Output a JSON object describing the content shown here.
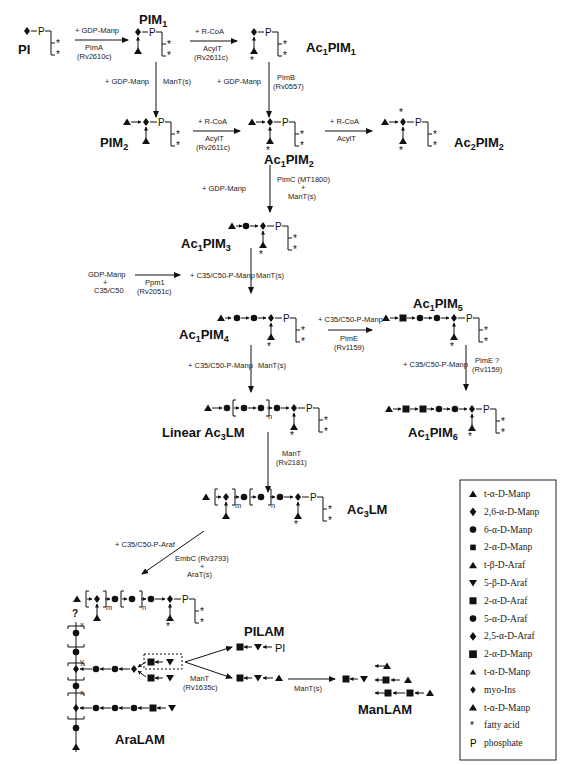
{
  "compounds": {
    "pi": "PI",
    "pim1": "PIM",
    "pim1_sub": "1",
    "ac1pim1": "Ac",
    "ac1pim1_sub1": "1",
    "ac1pim1_mid": "PIM",
    "ac1pim1_sub2": "1",
    "pim2": "PIM",
    "pim2_sub": "2",
    "ac1pim2": "Ac",
    "ac1pim2_sub1": "1",
    "ac1pim2_mid": "PIM",
    "ac1pim2_sub2": "2",
    "ac2pim2": "Ac",
    "ac2pim2_sub1": "2",
    "ac2pim2_mid": "PIM",
    "ac2pim2_sub2": "2",
    "ac1pim3": "Ac",
    "ac1pim3_sub1": "1",
    "ac1pim3_mid": "PIM",
    "ac1pim3_sub2": "3",
    "ac1pim4": "Ac",
    "ac1pim4_sub1": "1",
    "ac1pim4_mid": "PIM",
    "ac1pim4_sub2": "4",
    "ac1pim5": "Ac",
    "ac1pim5_sub1": "1",
    "ac1pim5_mid": "PIM",
    "ac1pim5_sub2": "5",
    "ac1pim6": "Ac",
    "ac1pim6_sub1": "1",
    "ac1pim6_mid": "PIM",
    "ac1pim6_sub2": "6",
    "linear_ac3lm": "Linear Ac",
    "linear_ac3lm_sub": "3",
    "linear_ac3lm_tail": "LM",
    "ac3lm": "Ac",
    "ac3lm_sub": "3",
    "ac3lm_tail": "LM",
    "pilam": "PILAM",
    "manlam": "ManLAM",
    "aralam": "AraLAM"
  },
  "reactions": {
    "pimA": {
      "substrate": "+ GDP-Manp",
      "enzyme": "PimA",
      "gene": "(Rv2610c)"
    },
    "acylT1": {
      "substrate": "+ R-CoA",
      "enzyme": "AcylT",
      "gene": "(Rv2611c)"
    },
    "manTs1": {
      "substrate": "+ GDP-Manp",
      "enzyme": "ManT(s)"
    },
    "pimB": {
      "substrate": "+ GDP-Manp",
      "enzyme": "PimB",
      "gene": "(Rv0557)"
    },
    "acylT2": {
      "substrate": "+ R-CoA",
      "enzyme": "AcylT",
      "gene": "(Rv2611c)"
    },
    "acylT3": {
      "substrate": "+ R-CoA",
      "enzyme": "AcylT"
    },
    "pimC": {
      "substrate": "+ GDP-Manp",
      "enzyme": "PimC (MT1800)",
      "plus": "+",
      "enzyme2": "ManT(s)"
    },
    "ppm1": {
      "substrate_a": "GDP-Manp",
      "plus": "+",
      "substrate_b": "C35/C50",
      "enzyme": "Ppm1",
      "gene": "(Rv2051c)"
    },
    "manTs2": {
      "substrate": "+ C35/C50-P-Manp",
      "enzyme": "ManT(s)"
    },
    "pimE": {
      "substrate": "+ C35/C50-P-Manp",
      "enzyme": "PimE",
      "gene": "(Rv1159)"
    },
    "pimE2": {
      "substrate": "+ C35/C50-P-Manp",
      "enzyme": "PimE ?",
      "gene": "(Rv1159)"
    },
    "manTs3": {
      "substrate": "+ C35/C50-P-Manp",
      "enzyme": "ManT(s)"
    },
    "manT_rv2181": {
      "enzyme": "ManT",
      "gene": "(Rv2181)"
    },
    "embC": {
      "substrate": "+ C35/C50-P-Araf",
      "enzyme": "EmbC (Rv3793)",
      "plus": "+",
      "enzyme2": "AraT(s)"
    },
    "manT_rv1635c": {
      "enzyme": "ManT",
      "gene": "(Rv1635c)"
    },
    "manTs4": {
      "enzyme": "ManT(s)"
    }
  },
  "symbols": {
    "phosphate": "P",
    "fatty_acid": "*",
    "n": "n",
    "m": "m",
    "x": "x",
    "y": "y",
    "question": "?",
    "pi_tail": "PI"
  },
  "legend": {
    "items": [
      {
        "icon": "triangle-up",
        "label": "t-α-D-Manp"
      },
      {
        "icon": "diamond",
        "label": "2,6-α-D-Manp"
      },
      {
        "icon": "circle",
        "label": "6-α-D-Manp"
      },
      {
        "icon": "square-small",
        "label": "2-α-D-Manp"
      },
      {
        "icon": "triangle-up",
        "label": "t-β-D-Araf"
      },
      {
        "icon": "triangle-down",
        "label": "5-β-D-Araf"
      },
      {
        "icon": "square",
        "label": "2-α-D-Araf"
      },
      {
        "icon": "circle",
        "label": "5-α-D-Araf"
      },
      {
        "icon": "diamond",
        "label": "2,5-α-D-Araf"
      },
      {
        "icon": "square-dark",
        "label": "2-α-D-Manp"
      },
      {
        "icon": "triangle-up-small",
        "label": "t-α-D-Manp"
      },
      {
        "icon": "diamond-small",
        "label": "myo-Ins"
      },
      {
        "icon": "triangle-up",
        "label": "t-α-D-Manp"
      },
      {
        "icon": "asterisk",
        "label": "fatty acid"
      },
      {
        "icon": "p-letter",
        "label": "phosphate"
      }
    ]
  }
}
